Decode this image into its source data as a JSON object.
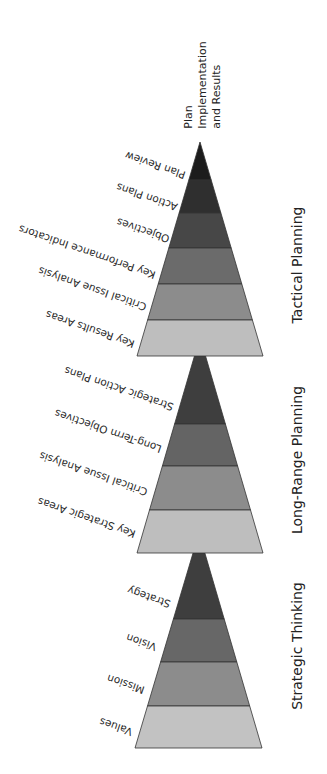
{
  "apex_label": {
    "lines": [
      "Plan",
      "Implementation",
      "and Results"
    ]
  },
  "pyramids": [
    {
      "id": "tactical",
      "title": "Tactical Planning",
      "title_pos": {
        "x": 297,
        "y": 265
      },
      "apex": {
        "x": 200,
        "y": 142
      },
      "base": {
        "y": 356,
        "x_left": 137,
        "x_right": 263
      },
      "bands": [
        {
          "label": "Plan Review",
          "from_y": 142,
          "to_y": 180,
          "color": "#1c1c1c",
          "label_anchor": {
            "x": 187,
            "y": 170
          }
        },
        {
          "label": "Action Plans",
          "from_y": 180,
          "to_y": 213,
          "color": "#2f2f2f",
          "label_anchor": {
            "x": 179,
            "y": 202
          }
        },
        {
          "label": "Objectives",
          "from_y": 213,
          "to_y": 248,
          "color": "#474747",
          "label_anchor": {
            "x": 171,
            "y": 234
          }
        },
        {
          "label": "Key Performance Indicators",
          "from_y": 248,
          "to_y": 284,
          "color": "#6b6b6b",
          "label_anchor": {
            "x": 157,
            "y": 270
          }
        },
        {
          "label": "Critical Issue Analysis",
          "from_y": 284,
          "to_y": 320,
          "color": "#8c8c8c",
          "label_anchor": {
            "x": 148,
            "y": 302
          }
        },
        {
          "label": "Key Results Areas",
          "from_y": 320,
          "to_y": 356,
          "color": "#bebebe",
          "label_anchor": {
            "x": 136,
            "y": 339
          }
        }
      ]
    },
    {
      "id": "long-range",
      "title": "Long-Range Planning",
      "title_pos": {
        "x": 297,
        "y": 460
      },
      "apex": {
        "x": 200,
        "y": 337
      },
      "base": {
        "y": 553,
        "x_left": 137,
        "x_right": 263
      },
      "bands": [
        {
          "label": "Strategic Action Plans",
          "from_y": 337,
          "to_y": 424,
          "color": "#3e3e3e",
          "label_anchor": {
            "x": 175,
            "y": 402
          }
        },
        {
          "label": "Long-Term Objectives",
          "from_y": 424,
          "to_y": 466,
          "color": "#646464",
          "label_anchor": {
            "x": 163,
            "y": 444
          }
        },
        {
          "label": "Critical Issue Analysis",
          "from_y": 466,
          "to_y": 510,
          "color": "#8c8c8c",
          "label_anchor": {
            "x": 149,
            "y": 487
          }
        },
        {
          "label": "Key Strategic Areas",
          "from_y": 510,
          "to_y": 553,
          "color": "#bebebe",
          "label_anchor": {
            "x": 137,
            "y": 529
          }
        }
      ]
    },
    {
      "id": "strategic",
      "title": "Strategic Thinking",
      "title_pos": {
        "x": 297,
        "y": 646
      },
      "apex": {
        "x": 199,
        "y": 533
      },
      "base": {
        "y": 748,
        "x_left": 135,
        "x_right": 262
      },
      "bands": [
        {
          "label": "Strategy",
          "from_y": 533,
          "to_y": 619,
          "color": "#3e3e3e",
          "label_anchor": {
            "x": 172,
            "y": 599
          }
        },
        {
          "label": "Vision",
          "from_y": 619,
          "to_y": 662,
          "color": "#676767",
          "label_anchor": {
            "x": 158,
            "y": 642
          }
        },
        {
          "label": "Mission",
          "from_y": 662,
          "to_y": 706,
          "color": "#8c8c8c",
          "label_anchor": {
            "x": 146,
            "y": 685
          }
        },
        {
          "label": "Values",
          "from_y": 706,
          "to_y": 748,
          "color": "#c2c2c2",
          "label_anchor": {
            "x": 134,
            "y": 727
          }
        }
      ]
    }
  ],
  "style": {
    "label_rotation_deg": 199,
    "outline_color": "#333333"
  }
}
